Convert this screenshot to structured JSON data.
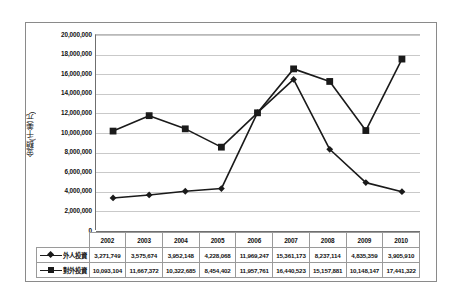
{
  "chart_data": {
    "type": "line",
    "title": "",
    "xlabel": "",
    "ylabel": "金額(千美元)",
    "categories": [
      "2002",
      "2003",
      "2004",
      "2005",
      "2006",
      "2007",
      "2008",
      "2009",
      "2010"
    ],
    "ylim": [
      0,
      20000000
    ],
    "ytick_step": 2000000,
    "grid": true,
    "legend_position": "table-left",
    "series": [
      {
        "name": "外人投資",
        "marker": "diamond",
        "color": "#1a1a1a",
        "values": [
          3271749,
          3575674,
          3952148,
          4228068,
          11969247,
          15361173,
          8237114,
          4835359,
          3905910
        ],
        "labels": [
          "3,271,749",
          "3,575,674",
          "3,952,148",
          "4,228,068",
          "11,969,247",
          "15,361,173",
          "8,237,114",
          "4,835,359",
          "3,905,910"
        ]
      },
      {
        "name": "對外投資",
        "marker": "square",
        "color": "#1a1a1a",
        "values": [
          10093104,
          11667372,
          10322685,
          8454402,
          11957761,
          16440523,
          15157881,
          10148147,
          17441322
        ],
        "labels": [
          "10,093,104",
          "11,667,372",
          "10,322,685",
          "8,454,402",
          "11,957,761",
          "16,440,523",
          "15,157,881",
          "10,148,147",
          "17,441,322"
        ]
      }
    ],
    "ytick_labels": [
      "20,000,000",
      "18,000,000",
      "16,000,000",
      "14,000,000",
      "12,000,000",
      "10,000,000",
      "8,000,000",
      "6,000,000",
      "4,000,000",
      "2,000,000",
      "0"
    ]
  },
  "table": {
    "header_row": [
      "",
      "2002",
      "2003",
      "2004",
      "2005",
      "2006",
      "2007",
      "2008",
      "2009",
      "2010"
    ],
    "rows": [
      {
        "label": "外人投資",
        "marker": "diamond",
        "values": [
          "3,271,749",
          "3,575,674",
          "3,952,148",
          "4,228,068",
          "11,969,247",
          "15,361,173",
          "8,237,114",
          "4,835,359",
          "3,905,910"
        ]
      },
      {
        "label": "對外投資",
        "marker": "square",
        "values": [
          "10,093,104",
          "11,667,372",
          "10,322,685",
          "8,454,402",
          "11,957,761",
          "16,440,523",
          "15,157,881",
          "10,148,147",
          "17,441,322"
        ]
      }
    ]
  },
  "colors": {
    "series": "#1a1a1a",
    "grid": "#c9c9c9",
    "frame": "#8a8a8a"
  }
}
